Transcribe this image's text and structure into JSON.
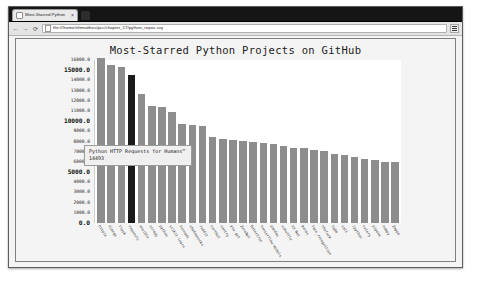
{
  "browser": {
    "tab": {
      "title": "Most-Starred Python",
      "close_label": "×"
    },
    "new_tab_label": "",
    "nav": {
      "back_label": "←",
      "forward_label": "→",
      "reload_label": "⟳"
    },
    "url": "file:///home/ehmatthes/pcc/chapter_17/python_repos.svg",
    "menu_label": ""
  },
  "tooltip": {
    "description": "Python HTTP Requests for Humans™",
    "value": "14493"
  },
  "chart_data": {
    "type": "bar",
    "title": "Most-Starred Python Projects on GitHub",
    "xlabel": "",
    "ylabel": "",
    "ylim": [
      0,
      16000
    ],
    "grid": false,
    "legend": "none",
    "highlight_index": 3,
    "bar_color": "#8d8d8d",
    "highlight_color": "#1a1a1a",
    "yticks": [
      {
        "label": "0.0",
        "value": 0,
        "major": true
      },
      {
        "label": "1000.0",
        "value": 1000,
        "major": false
      },
      {
        "label": "2000.0",
        "value": 2000,
        "major": false
      },
      {
        "label": "3000.0",
        "value": 3000,
        "major": false
      },
      {
        "label": "4000.0",
        "value": 4000,
        "major": false
      },
      {
        "label": "5000.0",
        "value": 5000,
        "major": true
      },
      {
        "label": "6000.0",
        "value": 6000,
        "major": false
      },
      {
        "label": "7000.0",
        "value": 7000,
        "major": false
      },
      {
        "label": "8000.0",
        "value": 8000,
        "major": false
      },
      {
        "label": "9000.0",
        "value": 9000,
        "major": false
      },
      {
        "label": "10000.0",
        "value": 10000,
        "major": true
      },
      {
        "label": "11000.0",
        "value": 11000,
        "major": false
      },
      {
        "label": "12000.0",
        "value": 12000,
        "major": false
      },
      {
        "label": "13000.0",
        "value": 13000,
        "major": false
      },
      {
        "label": "14000.0",
        "value": 14000,
        "major": false
      },
      {
        "label": "15000.0",
        "value": 15000,
        "major": true
      },
      {
        "label": "16000.0",
        "value": 16000,
        "major": false
      }
    ],
    "categories": [
      "httpie",
      "django",
      "flask",
      "requests",
      "ansible",
      "scrapy",
      "python",
      "scikit-learn",
      "tornado",
      "shadowsocks",
      "reddit",
      "certbot",
      "sentry",
      "you-get",
      "ZeroNet",
      "Detectron",
      "tensorflow-models",
      "pandas",
      "sshuttle",
      "XX-Net",
      "keras",
      "face_recognition",
      "thefuck",
      "tqdm",
      "salt",
      "ipython",
      "celery",
      "pipenv",
      "numpy",
      "Zappa"
    ],
    "values": [
      16221,
      15529,
      15286,
      14493,
      12709,
      11459,
      11349,
      10946,
      9724,
      9647,
      9536,
      8477,
      8235,
      8100,
      8012,
      7960,
      7902,
      7787,
      7602,
      7365,
      7322,
      7190,
      7105,
      6733,
      6630,
      6500,
      6320,
      6190,
      6010,
      5970
    ]
  }
}
